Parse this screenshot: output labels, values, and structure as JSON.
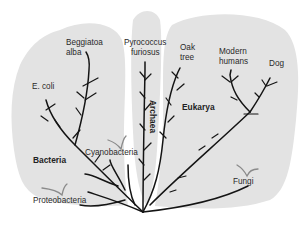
{
  "diagram": {
    "type": "phylogenetic-tree",
    "colors": {
      "background": "#ffffff",
      "domain_fill": "#e3e3e3",
      "branch": "#141414",
      "label": "#2a2a2a",
      "extinct_marker": "#8a8a8a"
    },
    "domains": [
      {
        "id": "bacteria",
        "label": "Bacteria"
      },
      {
        "id": "archaea",
        "label": "Archaea"
      },
      {
        "id": "eukarya",
        "label": "Eukarya"
      }
    ],
    "leaves": {
      "beggiatoa": {
        "line1": "Beggiatoa",
        "line2": "alba",
        "domain": "Bacteria"
      },
      "ecoli": {
        "label": "E. coli",
        "domain": "Bacteria"
      },
      "cyanobacteria": {
        "label": "Cyanobacteria",
        "domain": "Bacteria"
      },
      "proteobacteria": {
        "label": "Proteobacteria",
        "domain": "Bacteria"
      },
      "pyrococcus": {
        "line1": "Pyrococcus",
        "line2": "furiosus",
        "domain": "Archaea"
      },
      "oak": {
        "line1": "Oak",
        "line2": "tree",
        "domain": "Eukarya"
      },
      "humans": {
        "line1": "Modern",
        "line2": "humans",
        "domain": "Eukarya"
      },
      "dog": {
        "label": "Dog",
        "domain": "Eukarya"
      },
      "fungi": {
        "label": "Fungi",
        "domain": "Eukarya"
      }
    }
  }
}
